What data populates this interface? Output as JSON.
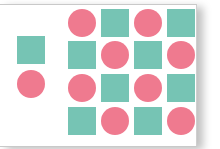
{
  "colors": {
    "circle": "#ef7a8f",
    "square": "#76c4b4",
    "background": "#ffffff"
  },
  "left_group": [
    {
      "type": "square",
      "x": 17,
      "y": 36
    },
    {
      "type": "circle",
      "x": 17,
      "y": 70
    }
  ],
  "grid": {
    "columns": [
      68,
      101,
      134,
      167
    ],
    "rows": [
      9,
      41,
      74,
      107
    ],
    "cells": [
      [
        "circle",
        "square",
        "circle",
        "square"
      ],
      [
        "square",
        "circle",
        "square",
        "circle"
      ],
      [
        "circle",
        "square",
        "circle",
        "square"
      ],
      [
        "square",
        "circle",
        "square",
        "circle"
      ]
    ]
  }
}
